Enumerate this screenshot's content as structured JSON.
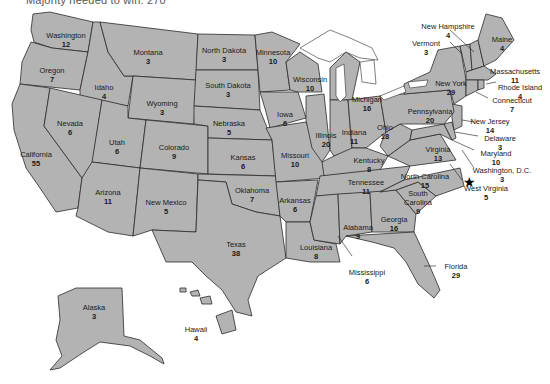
{
  "caption": "Majority needed to win: 270",
  "map": {
    "title": "Electoral votes by state",
    "fill_color": "#b3b3b3",
    "border_color": "#2b2b2b",
    "capital_marker": "star-icon"
  },
  "states": [
    {
      "name": "Washington",
      "votes": "12"
    },
    {
      "name": "Oregon",
      "votes": "7"
    },
    {
      "name": "California",
      "votes": "55"
    },
    {
      "name": "Idaho",
      "votes": "4"
    },
    {
      "name": "Nevada",
      "votes": "6"
    },
    {
      "name": "Montana",
      "votes": "3"
    },
    {
      "name": "Wyoming",
      "votes": "3"
    },
    {
      "name": "Utah",
      "votes": "6"
    },
    {
      "name": "Arizona",
      "votes": "11"
    },
    {
      "name": "Colorado",
      "votes": "9"
    },
    {
      "name": "New Mexico",
      "votes": "5"
    },
    {
      "name": "North Dakota",
      "votes": "3"
    },
    {
      "name": "South Dakota",
      "votes": "3"
    },
    {
      "name": "Nebraska",
      "votes": "5"
    },
    {
      "name": "Kansas",
      "votes": "6"
    },
    {
      "name": "Oklahoma",
      "votes": "7"
    },
    {
      "name": "Texas",
      "votes": "38"
    },
    {
      "name": "Minnesota",
      "votes": "10"
    },
    {
      "name": "Iowa",
      "votes": "6"
    },
    {
      "name": "Missouri",
      "votes": "10"
    },
    {
      "name": "Arkansas",
      "votes": "6"
    },
    {
      "name": "Louisiana",
      "votes": "8"
    },
    {
      "name": "Wisconsin",
      "votes": "10"
    },
    {
      "name": "Illinois",
      "votes": "20"
    },
    {
      "name": "Michigan",
      "votes": "16"
    },
    {
      "name": "Indiana",
      "votes": "11"
    },
    {
      "name": "Ohio",
      "votes": "18"
    },
    {
      "name": "Kentucky",
      "votes": "8"
    },
    {
      "name": "Tennessee",
      "votes": "11"
    },
    {
      "name": "Mississippi",
      "votes": "6"
    },
    {
      "name": "Alabama",
      "votes": "9"
    },
    {
      "name": "Georgia",
      "votes": "16"
    },
    {
      "name": "Florida",
      "votes": "29"
    },
    {
      "name": "South Carolina",
      "votes": "9"
    },
    {
      "name": "North Carolina",
      "votes": "15"
    },
    {
      "name": "Virginia",
      "votes": "13"
    },
    {
      "name": "West Virginia",
      "votes": "5"
    },
    {
      "name": "Washington, D.C.",
      "votes": "3"
    },
    {
      "name": "Maryland",
      "votes": "10"
    },
    {
      "name": "Delaware",
      "votes": "3"
    },
    {
      "name": "New Jersey",
      "votes": "14"
    },
    {
      "name": "Pennsylvania",
      "votes": "20"
    },
    {
      "name": "New York",
      "votes": "29"
    },
    {
      "name": "Connecticut",
      "votes": "7"
    },
    {
      "name": "Rhode Island",
      "votes": "4"
    },
    {
      "name": "Massachusetts",
      "votes": "11"
    },
    {
      "name": "Vermont",
      "votes": "3"
    },
    {
      "name": "New Hampshire",
      "votes": "4"
    },
    {
      "name": "Maine",
      "votes": "4"
    },
    {
      "name": "Alaska",
      "votes": "3"
    },
    {
      "name": "Hawaii",
      "votes": "4"
    }
  ]
}
